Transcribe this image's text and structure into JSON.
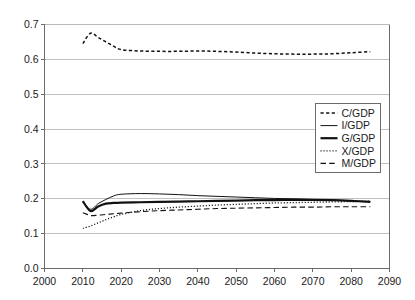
{
  "chart_data": {
    "type": "line",
    "title": "",
    "subtitle": "",
    "xlabel": "",
    "ylabel": "",
    "xlim": [
      2000,
      2090
    ],
    "ylim": [
      0.0,
      0.7
    ],
    "grid": true,
    "legend_position": "center-right",
    "x_ticks": [
      "2000",
      "2010",
      "2020",
      "2030",
      "2040",
      "2050",
      "2060",
      "2070",
      "2080",
      "2090"
    ],
    "y_ticks": [
      "0.0",
      "0.1",
      "0.2",
      "0.3",
      "0.4",
      "0.5",
      "0.6",
      "0.7"
    ],
    "x": [
      2010,
      2012,
      2014,
      2016,
      2018,
      2020,
      2025,
      2030,
      2035,
      2040,
      2045,
      2050,
      2055,
      2060,
      2065,
      2070,
      2075,
      2080,
      2085
    ],
    "series": [
      {
        "name": "C/GDP",
        "style": "dashed",
        "values": [
          0.645,
          0.675,
          0.663,
          0.65,
          0.638,
          0.628,
          0.624,
          0.623,
          0.623,
          0.624,
          0.623,
          0.621,
          0.618,
          0.616,
          0.615,
          0.615,
          0.616,
          0.619,
          0.622
        ]
      },
      {
        "name": "I/GDP",
        "style": "thin-solid",
        "values": [
          0.192,
          0.17,
          0.186,
          0.198,
          0.208,
          0.213,
          0.215,
          0.214,
          0.212,
          0.209,
          0.207,
          0.205,
          0.203,
          0.201,
          0.2,
          0.198,
          0.196,
          0.194,
          0.192
        ]
      },
      {
        "name": "G/GDP",
        "style": "thick-solid",
        "values": [
          0.193,
          0.165,
          0.178,
          0.186,
          0.188,
          0.189,
          0.19,
          0.191,
          0.192,
          0.193,
          0.194,
          0.195,
          0.196,
          0.196,
          0.197,
          0.197,
          0.196,
          0.194,
          0.191
        ]
      },
      {
        "name": "X/GDP",
        "style": "dotted",
        "values": [
          0.115,
          0.122,
          0.131,
          0.14,
          0.148,
          0.155,
          0.166,
          0.172,
          0.176,
          0.179,
          0.182,
          0.184,
          0.186,
          0.188,
          0.189,
          0.19,
          0.191,
          0.192,
          0.193
        ]
      },
      {
        "name": "M/GDP",
        "style": "long-dashed",
        "values": [
          0.16,
          0.152,
          0.153,
          0.155,
          0.157,
          0.159,
          0.163,
          0.166,
          0.168,
          0.17,
          0.172,
          0.173,
          0.174,
          0.175,
          0.176,
          0.176,
          0.177,
          0.177,
          0.177
        ]
      }
    ],
    "legend": [
      {
        "label": "C/GDP",
        "style": "dashed"
      },
      {
        "label": "I/GDP",
        "style": "thin-solid"
      },
      {
        "label": "G/GDP",
        "style": "thick-solid"
      },
      {
        "label": "X/GDP",
        "style": "dotted"
      },
      {
        "label": "M/GDP",
        "style": "long-dashed"
      }
    ],
    "colors": {
      "series": "#111111",
      "grid": "#b9b9b9",
      "axis": "#6b6b6b",
      "background": "#ffffff",
      "text": "#1a1a1a"
    }
  }
}
